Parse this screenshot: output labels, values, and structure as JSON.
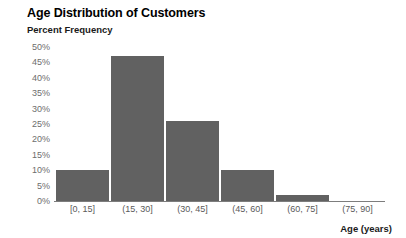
{
  "chart_data": {
    "type": "bar",
    "title": "Age Distribution of Customers",
    "xlabel": "Age (years)",
    "ylabel": "Percent Frequency",
    "categories": [
      "[0, 15]",
      "(15, 30]",
      "(30, 45]",
      "(45, 60]",
      "(60, 75]",
      "(75, 90]"
    ],
    "values": [
      10,
      47,
      26,
      10,
      2,
      0
    ],
    "ylim": [
      0,
      50
    ],
    "ytick_labels": [
      "50%",
      "45%",
      "40%",
      "35%",
      "30%",
      "25%",
      "20%",
      "15%",
      "10%",
      "5%",
      "0%"
    ],
    "ytick_values": [
      50,
      45,
      40,
      35,
      30,
      25,
      20,
      15,
      10,
      5,
      0
    ],
    "grid": false,
    "legend": false,
    "bar_color": "#616161",
    "axis_color": "#7d7d7d",
    "title_color": "#000000",
    "tick_color": "#6d6d6d"
  }
}
